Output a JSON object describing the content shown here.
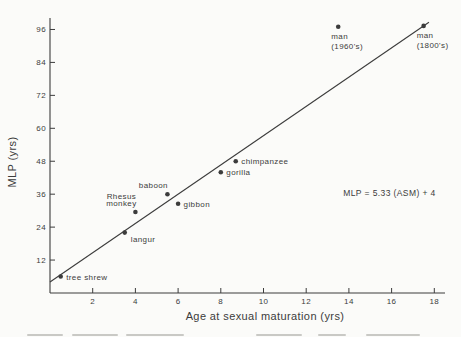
{
  "figure": {
    "background": "#fbfbf9",
    "ink": "#3c3c3c",
    "cropped_caption_visible": true
  },
  "chart_data": {
    "type": "scatter",
    "title": "",
    "xlabel": "Age at sexual maturation (yrs)",
    "ylabel": "MLP  (yrs)",
    "xlim": [
      0,
      18.6
    ],
    "ylim": [
      0,
      101
    ],
    "x_ticks": [
      2,
      4,
      6,
      8,
      10,
      12,
      14,
      16,
      18
    ],
    "y_ticks": [
      12,
      24,
      36,
      48,
      60,
      72,
      84,
      96
    ],
    "grid": false,
    "legend": "none",
    "points": [
      {
        "name": "tree shrew",
        "x": 0.5,
        "y": 6,
        "label_lines": [
          "tree shrew"
        ],
        "label_pos": "right"
      },
      {
        "name": "langur",
        "x": 3.5,
        "y": 22,
        "label_lines": [
          "langur"
        ],
        "label_pos": "below-right"
      },
      {
        "name": "Rhesus monkey",
        "x": 4.0,
        "y": 29.5,
        "label_lines": [
          "Rhesus",
          "monkey"
        ],
        "label_pos": "above-left"
      },
      {
        "name": "baboon",
        "x": 5.5,
        "y": 36,
        "label_lines": [
          "baboon"
        ],
        "label_pos": "above-left"
      },
      {
        "name": "gibbon",
        "x": 6.0,
        "y": 32.5,
        "label_lines": [
          "gibbon"
        ],
        "label_pos": "right"
      },
      {
        "name": "gorilla",
        "x": 8.0,
        "y": 44,
        "label_lines": [
          "gorilla"
        ],
        "label_pos": "right"
      },
      {
        "name": "chimpanzee",
        "x": 8.7,
        "y": 48,
        "label_lines": [
          "chimpanzee"
        ],
        "label_pos": "right"
      },
      {
        "name": "man (1960's)",
        "x": 13.5,
        "y": 97,
        "label_lines": [
          "man",
          "(1960's)"
        ],
        "label_pos": "below-left"
      },
      {
        "name": "man (1800's)",
        "x": 17.5,
        "y": 97.3,
        "label_lines": [
          "man",
          "(1800's)"
        ],
        "label_pos": "below-left"
      }
    ],
    "trendline": {
      "slope": 5.33,
      "intercept": 4,
      "x_start": 0.0,
      "x_end": 17.75
    },
    "annotation": {
      "text": "MLP = 5.33 (ASM) + 4",
      "x": 15.9,
      "y": 36.4
    }
  }
}
